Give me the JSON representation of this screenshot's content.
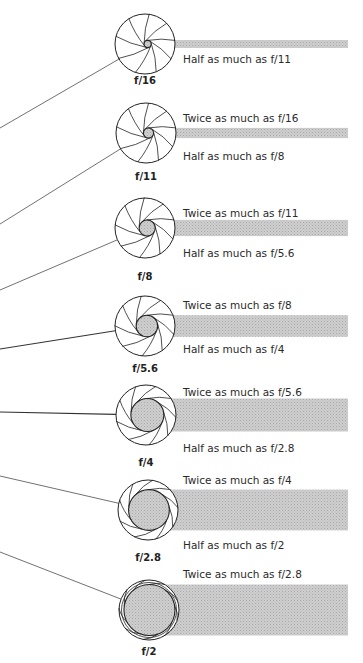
{
  "diagram": {
    "colors": {
      "outline": "#222222",
      "bar_fill": "#c9c9c9",
      "opening_fill": "#c4c4c4",
      "line": "#333333"
    },
    "stops": [
      {
        "label": "f/16",
        "aperture_fraction": 0.12,
        "twice_text": "",
        "half_text": "Half as much as f/11"
      },
      {
        "label": "f/11",
        "aperture_fraction": 0.17,
        "twice_text": "Twice as much as f/16",
        "half_text": "Half as much as f/8"
      },
      {
        "label": "f/8",
        "aperture_fraction": 0.27,
        "twice_text": "Twice as much as f/11",
        "half_text": "Half as much as f/5.6"
      },
      {
        "label": "f/5.6",
        "aperture_fraction": 0.36,
        "twice_text": "Twice as much as f/8",
        "half_text": "Half as much as f/4"
      },
      {
        "label": "f/4",
        "aperture_fraction": 0.55,
        "twice_text": "Twice as much as f/5.6",
        "half_text": "Half as much as f/2.8"
      },
      {
        "label": "f/2.8",
        "aperture_fraction": 0.68,
        "twice_text": "Twice as much as f/4",
        "half_text": "Half as much as f/2"
      },
      {
        "label": "f/2",
        "aperture_fraction": 0.85,
        "twice_text": "Twice as much as f/2.8",
        "half_text": ""
      }
    ]
  }
}
